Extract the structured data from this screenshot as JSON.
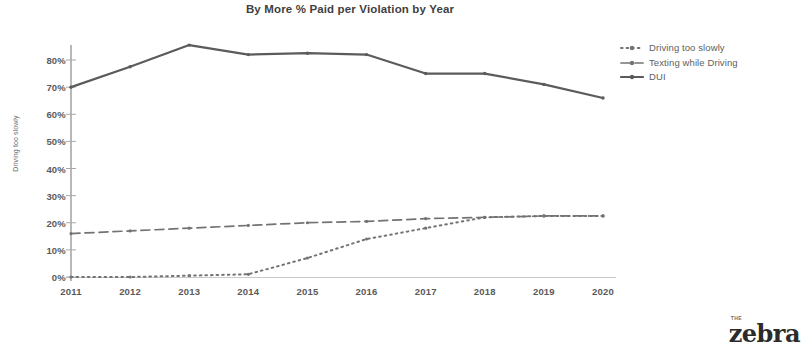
{
  "chart_data": {
    "type": "line",
    "title": "By More % Paid per Violation by Year",
    "xlabel": "",
    "ylabel": "Driving too slowly",
    "categories": [
      "2011",
      "2012",
      "2013",
      "2014",
      "2015",
      "2016",
      "2017",
      "2018",
      "2019",
      "2020"
    ],
    "ylim": [
      0,
      80
    ],
    "ytick_labels": [
      "0%",
      "10%",
      "20%",
      "30%",
      "40%",
      "50%",
      "60%",
      "70%",
      "80%"
    ],
    "ytick_values": [
      0,
      10,
      20,
      30,
      40,
      50,
      60,
      70,
      80
    ],
    "grid": false,
    "legend_position": "right",
    "series": [
      {
        "name": "Driving too slowly",
        "style": "dotted",
        "color": "#737373",
        "values": [
          0,
          0,
          0.5,
          1,
          7,
          14,
          18,
          22,
          22.5,
          22.5
        ]
      },
      {
        "name": "Texting while Driving",
        "style": "dashed",
        "color": "#737373",
        "values": [
          16,
          17,
          18,
          19,
          20,
          20.5,
          21.5,
          22,
          22.5,
          22.5
        ]
      },
      {
        "name": "DUI",
        "style": "solid",
        "color": "#5b5b5b",
        "values": [
          70,
          77.5,
          85.5,
          82,
          82.5,
          82,
          75,
          75,
          71,
          66
        ]
      }
    ]
  },
  "legend": {
    "items": [
      {
        "label": "Driving too slowly",
        "marker": "dotted-line-marker"
      },
      {
        "label": "Texting while Driving",
        "marker": "dashed-line-marker"
      },
      {
        "label": "DUI",
        "marker": "solid-line-marker"
      }
    ]
  },
  "brand": {
    "prefix": "THE",
    "name": "zebra"
  },
  "colors": {
    "axis": "#9a9a9a",
    "text": "#5a5a5a",
    "dui_line": "#5b5b5b",
    "texting_line": "#737373",
    "slowly_line": "#737373",
    "background": "#ffffff"
  }
}
